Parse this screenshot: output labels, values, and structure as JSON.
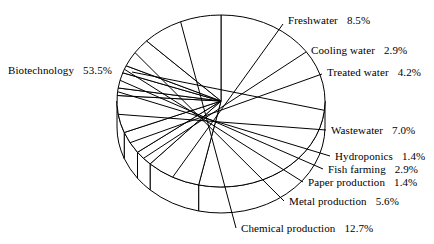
{
  "chart_data": {
    "type": "pie",
    "title": "",
    "subtitle": "",
    "xlabel": "",
    "ylabel": "",
    "legend_position": "none",
    "grid": false,
    "value_unit": "%",
    "three_d": true,
    "start_angle_deg": 0,
    "direction": "clockwise",
    "categories": [
      "Biotechnology",
      "Freshwater",
      "Cooling water",
      "Treated water",
      "Wastewater",
      "Hydroponics",
      "Fish farming",
      "Paper production",
      "Metal production",
      "Chemical production"
    ],
    "values": [
      53.5,
      8.5,
      2.9,
      4.2,
      7.0,
      1.4,
      2.9,
      1.4,
      5.6,
      12.7
    ],
    "slices": [
      {
        "label": "Biotechnology",
        "value": "53.5%",
        "percent": 53.5
      },
      {
        "label": "Freshwater",
        "value": "8.5%",
        "percent": 8.5
      },
      {
        "label": "Cooling water",
        "value": "2.9%",
        "percent": 2.9
      },
      {
        "label": "Treated water",
        "value": "4.2%",
        "percent": 4.2
      },
      {
        "label": "Wastewater",
        "value": "7.0%",
        "percent": 7.0
      },
      {
        "label": "Hydroponics",
        "value": "1.4%",
        "percent": 1.4
      },
      {
        "label": "Fish farming",
        "value": "2.9%",
        "percent": 2.9
      },
      {
        "label": "Paper production",
        "value": "1.4%",
        "percent": 1.4
      },
      {
        "label": "Metal production",
        "value": "5.6%",
        "percent": 5.6
      },
      {
        "label": "Chemical production",
        "value": "12.7%",
        "percent": 12.7
      }
    ],
    "colors": {
      "slice_fill": "#ffffff",
      "slice_stroke": "#000000",
      "background": "#ffffff",
      "text": "#000000"
    }
  },
  "geometry": {
    "cx": 221,
    "cy": 101,
    "rx": 104,
    "ry": 86,
    "depth": 26
  },
  "label_layout": [
    {
      "key": "Biotechnology",
      "x": 8,
      "y": 64,
      "align": "left",
      "anchor_x": 132,
      "anchor_y": 72
    },
    {
      "key": "Freshwater",
      "x": 288,
      "y": 14,
      "align": "right",
      "anchor_x": 283,
      "anchor_y": 24
    },
    {
      "key": "Cooling water",
      "x": 311,
      "y": 44,
      "align": "right",
      "anchor_x": 306,
      "anchor_y": 52
    },
    {
      "key": "Treated water",
      "x": 327,
      "y": 66,
      "align": "right",
      "anchor_x": 322,
      "anchor_y": 74
    },
    {
      "key": "Wastewater",
      "x": 331,
      "y": 124,
      "align": "right",
      "anchor_x": 326,
      "anchor_y": 130
    },
    {
      "key": "Hydroponics",
      "x": 335,
      "y": 150,
      "align": "right",
      "anchor_x": 330,
      "anchor_y": 156
    },
    {
      "key": "Fish farming",
      "x": 328,
      "y": 163,
      "align": "right",
      "anchor_x": 323,
      "anchor_y": 169
    },
    {
      "key": "Paper production",
      "x": 308,
      "y": 176,
      "align": "right",
      "anchor_x": 303,
      "anchor_y": 182
    },
    {
      "key": "Metal production",
      "x": 289,
      "y": 195,
      "align": "right",
      "anchor_x": 284,
      "anchor_y": 201
    },
    {
      "key": "Chemical production",
      "x": 241,
      "y": 222,
      "align": "right",
      "anchor_x": 236,
      "anchor_y": 228
    }
  ]
}
